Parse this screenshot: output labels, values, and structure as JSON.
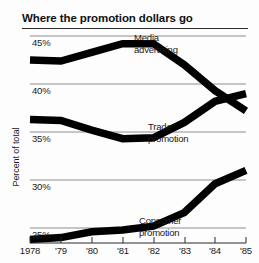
{
  "chart_data": {
    "type": "line",
    "title": "Where the promotion dollars go",
    "xlabel": "",
    "ylabel": "Percent of total",
    "x": [
      1978,
      1979,
      1980,
      1981,
      1982,
      1983,
      1984,
      1985
    ],
    "xtick_labels": [
      "1978",
      "'79",
      "'80",
      "'81",
      "'82",
      "'83",
      "'84",
      "'85"
    ],
    "ytick_labels": [
      "45%",
      "40%",
      "35%",
      "30%",
      "25%"
    ],
    "ytick_values": [
      45,
      40,
      35,
      30,
      25
    ],
    "ylim": [
      22.5,
      46.5
    ],
    "grid": "horizontal",
    "legend": "inline-annotations",
    "series": [
      {
        "name": "Media advertising",
        "label": "Media\nadvertising",
        "label_line1": "Media",
        "label_line2": "advertising",
        "color": "#000000",
        "values": [
          42.5,
          42.4,
          43.3,
          44.2,
          44.2,
          42.0,
          39.3,
          37.2
        ]
      },
      {
        "name": "Trade promotion",
        "label": "Trade\npromotion",
        "label_line1": "Trade",
        "label_line2": "promotion",
        "color": "#000000",
        "values": [
          36.3,
          36.2,
          35.2,
          34.3,
          34.4,
          36.0,
          38.2,
          39.0
        ]
      },
      {
        "name": "Consumer promotion",
        "label": "Consumer\npromotion",
        "label_line1": "Consumer",
        "label_line2": "promotion",
        "color": "#000000",
        "values": [
          23.8,
          24.0,
          24.6,
          24.8,
          25.2,
          26.6,
          29.6,
          31.0
        ]
      }
    ]
  },
  "figure": {
    "title": "Where the promotion dollars go",
    "axis_title_y": "Percent of total",
    "background": "#fdfdfd",
    "line_color": "#000000",
    "grid_color": "#9a9a9a",
    "axis_color": "#2b2b2b"
  }
}
